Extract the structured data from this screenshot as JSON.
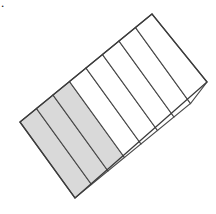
{
  "figure": {
    "label": ".",
    "shape_type": "rotated-rectangle-partitioned",
    "rotation_degrees": -39,
    "total_parts": 8,
    "shaded_parts": 3,
    "unshaded_parts": 5,
    "fraction_shaded": "3/8",
    "colors": {
      "shaded_fill": "#d9d9d9",
      "unshaded_fill": "#ffffff",
      "divider_stroke": "#4a4a4a",
      "outline_stroke": "#3c3c3c",
      "background": "#ffffff"
    },
    "corners": {
      "left": [
        20,
        122
      ],
      "top": [
        152,
        14
      ],
      "right": [
        207,
        82
      ],
      "bottom": [
        75,
        198
      ]
    },
    "parts": [
      {
        "index": 1,
        "state": "shaded"
      },
      {
        "index": 2,
        "state": "shaded"
      },
      {
        "index": 3,
        "state": "shaded"
      },
      {
        "index": 4,
        "state": "unshaded"
      },
      {
        "index": 5,
        "state": "unshaded"
      },
      {
        "index": 6,
        "state": "unshaded"
      },
      {
        "index": 7,
        "state": "unshaded"
      },
      {
        "index": 8,
        "state": "unshaded"
      }
    ]
  }
}
